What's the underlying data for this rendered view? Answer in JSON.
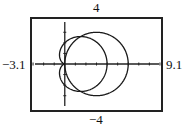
{
  "chart_data": {
    "type": "line",
    "title": "",
    "subtitle": "Polar graphs in a graphing-calculator viewing window",
    "xlabel": "",
    "ylabel": "",
    "window": {
      "xmin": -3.1,
      "xmax": 9.1,
      "ymin": -4,
      "ymax": 4,
      "xscl": 1,
      "yscl": 1
    },
    "xlim": [
      -3.1,
      9.1
    ],
    "ylim": [
      -4,
      4
    ],
    "window_labels": {
      "top": "4",
      "bottom": "−4",
      "left": "−3.1",
      "right": "9.1"
    },
    "grid": false,
    "legend": null,
    "series": [
      {
        "name": "circle",
        "equation": "r = 6cos(θ)",
        "shape": "circle centered (3,0) radius 3",
        "x_extent": [
          0,
          6
        ],
        "y_extent": [
          -3,
          3
        ]
      },
      {
        "name": "cardioid",
        "equation": "r = 2 + 2cos(θ)",
        "shape": "cardioid with cusp at origin",
        "x_extent": [
          -0.5,
          4
        ],
        "y_extent": [
          -2.6,
          2.6
        ]
      }
    ],
    "intersections": [
      [
        0,
        0
      ],
      [
        3,
        2.6
      ],
      [
        3,
        -2.6
      ]
    ]
  },
  "colors": {
    "curve": "#1a1a1a",
    "frame": "#222222",
    "axis": "#222222",
    "background": "#ffffff"
  }
}
